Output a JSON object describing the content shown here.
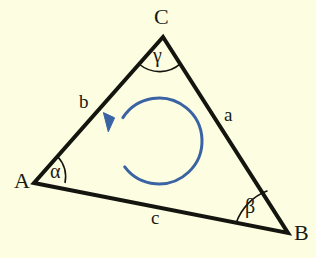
{
  "figure": {
    "background_color": "#fdfde2",
    "line_color": "#151510",
    "arrow_color": "#3a63a4",
    "vertices": [
      {
        "id": "A",
        "label": "A",
        "x": 34,
        "y": 183,
        "label_x": 14,
        "label_y": 170
      },
      {
        "id": "B",
        "label": "B",
        "x": 288,
        "y": 233,
        "label_x": 294,
        "label_y": 222
      },
      {
        "id": "C",
        "label": "C",
        "x": 163,
        "y": 37,
        "label_x": 154,
        "label_y": 6
      }
    ],
    "sides": [
      {
        "id": "a",
        "label": "a",
        "from": "C",
        "to": "B",
        "label_x": 224,
        "label_y": 105
      },
      {
        "id": "b",
        "label": "b",
        "from": "A",
        "to": "C",
        "label_x": 79,
        "label_y": 92
      },
      {
        "id": "c",
        "label": "c",
        "from": "A",
        "to": "B",
        "label_x": 151,
        "label_y": 208
      }
    ],
    "angles": [
      {
        "id": "alpha",
        "label": "α",
        "at_vertex": "A",
        "label_x": 50,
        "label_y": 161
      },
      {
        "id": "beta",
        "label": "β",
        "at_vertex": "B",
        "label_x": 245,
        "label_y": 196
      },
      {
        "id": "gamma",
        "label": "γ",
        "at_vertex": "C",
        "label_x": 153,
        "label_y": 45
      }
    ],
    "orientation_arrow": {
      "id": "counterclockwise-arrow",
      "direction": "counterclockwise",
      "center_x": 159,
      "center_y": 141,
      "radius": 43,
      "color": "#3a63a4",
      "stroke_width": 3
    }
  }
}
